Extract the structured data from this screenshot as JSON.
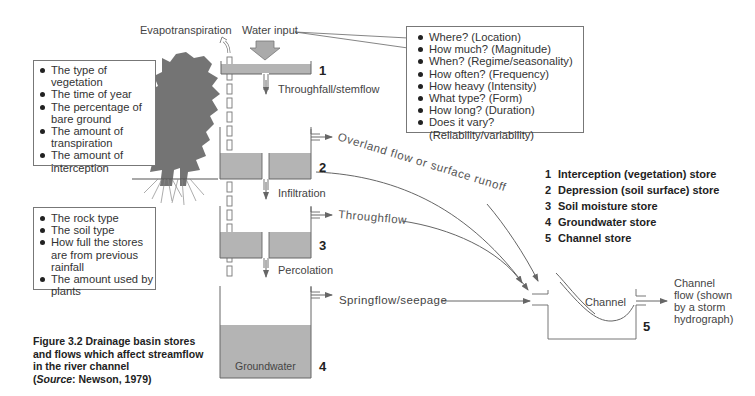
{
  "labels": {
    "evapotranspiration": "Evapotranspiration",
    "water_input": "Water input",
    "throughfall": "Throughfall/stemflow",
    "overland_flow": "Overland flow or surface runoff",
    "infiltration": "Infiltration",
    "throughflow": "Throughflow",
    "percolation": "Percolation",
    "springflow": "Springflow/seepage",
    "groundwater": "Groundwater",
    "channel": "Channel",
    "channel_flow": [
      "Channel",
      "flow (shown",
      "by a storm",
      "hydrograph)"
    ]
  },
  "store_numbers": [
    "1",
    "2",
    "3",
    "4",
    "5"
  ],
  "vegetation_factors": [
    "The type of vegetation",
    "The time of year",
    "The percentage of bare ground",
    "The amount of transpiration",
    "The amount of interception"
  ],
  "ground_factors": [
    "The rock type",
    "The soil type",
    "How full the stores are from previous rainfall",
    "The amount used by plants"
  ],
  "input_questions": [
    "Where? (Location)",
    "How much? (Magnitude)",
    "When? (Regime/seasonality)",
    "How often? (Frequency)",
    "How heavy (Intensity)",
    "What type? (Form)",
    "How long? (Duration)",
    "Does it vary? (Reliability/variability)"
  ],
  "legend": [
    {
      "n": "1",
      "label": "Interception (vegetation) store"
    },
    {
      "n": "2",
      "label": "Depression (soil surface) store"
    },
    {
      "n": "3",
      "label": "Soil moisture store"
    },
    {
      "n": "4",
      "label": "Groundwater store"
    },
    {
      "n": "5",
      "label": "Channel store"
    }
  ],
  "caption": {
    "title": "Figure 3.2  Drainage basin stores and flows which affect streamflow in the river channel",
    "source_prefix": "(",
    "source_label": "Source",
    "source_text": ": Newson, 1979)"
  },
  "colors": {
    "water_fill": "#b4b4b4",
    "line": "#6a6a6a",
    "tree": "#727272"
  }
}
